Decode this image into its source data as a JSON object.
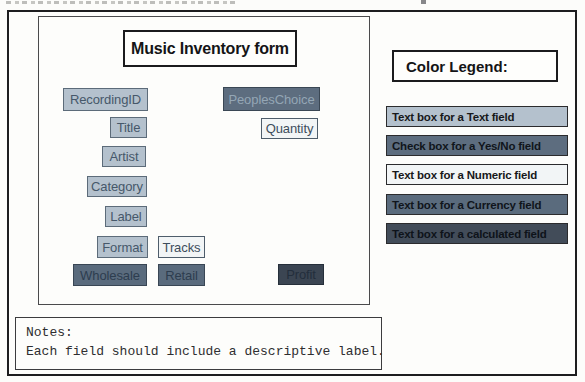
{
  "form": {
    "title": "Music Inventory form",
    "fields": [
      {
        "label": "RecordingID",
        "type": "text"
      },
      {
        "label": "PeoplesChoice",
        "type": "yesno"
      },
      {
        "label": "Title",
        "type": "text"
      },
      {
        "label": "Quantity",
        "type": "numeric"
      },
      {
        "label": "Artist",
        "type": "text"
      },
      {
        "label": "Category",
        "type": "text"
      },
      {
        "label": "Label",
        "type": "text"
      },
      {
        "label": "Format",
        "type": "text"
      },
      {
        "label": "Tracks",
        "type": "numeric"
      },
      {
        "label": "Wholesale",
        "type": "currency"
      },
      {
        "label": "Retail",
        "type": "currency"
      },
      {
        "label": "Profit",
        "type": "calculated"
      }
    ]
  },
  "legend": {
    "title": "Color Legend:",
    "entries": [
      {
        "label": "Text box for a Text field",
        "bg": "#b4c1cd",
        "fg": "#17181a"
      },
      {
        "label": "Check box for a Yes/No field",
        "bg": "#5d6d7f",
        "fg": "#10151b"
      },
      {
        "label": "Text box for a Numeric field",
        "bg": "#f2f5f6",
        "fg": "#17181a"
      },
      {
        "label": "Text box for a Currency field",
        "bg": "#5a6b7d",
        "fg": "#10151b"
      },
      {
        "label": "Text box for a calculated field",
        "bg": "#424c59",
        "fg": "#0e131a"
      }
    ]
  },
  "notes": {
    "heading": "Notes:",
    "body": "Each field should include a descriptive label."
  },
  "colors": {
    "field_types": {
      "text": {
        "bg": "#b4c1cd",
        "fg": "#46586a",
        "border": "#5c6b79"
      },
      "yesno": {
        "bg": "#5d6d7f",
        "fg": "#94a6b5",
        "border": "#3a4754"
      },
      "numeric": {
        "bg": "#f2f5f6",
        "fg": "#3d4d5c",
        "border": "#4e5d6b"
      },
      "currency": {
        "bg": "#5a6b7d",
        "fg": "#2d3d4f",
        "border": "#394654"
      },
      "calculated": {
        "bg": "#3b4552",
        "fg": "#232e3c",
        "border": "#262f3a"
      }
    }
  }
}
